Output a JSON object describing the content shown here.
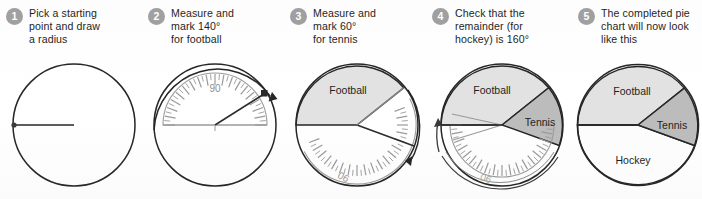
{
  "document": {
    "title": "Drawing a pie chart step by step",
    "background_color": "#ffffff"
  },
  "palette": {
    "badge_fill": "#a0a0a0",
    "badge_text": "#ffffff",
    "outline": "#262626",
    "football_fill": "#e2e2e2",
    "tennis_fill": "#bcbcbc",
    "hockey_fill": "#fcfcfc",
    "protractor_line": "#9a9a9a",
    "text": "#1f1f1f"
  },
  "steps": [
    {
      "number": "1",
      "text": "Pick a starting\npoint and draw\na radius",
      "figure": "circle-with-radius",
      "labels": []
    },
    {
      "number": "2",
      "text": "Measure and\nmark 140°\nfor football",
      "figure": "protractor-top-measure-140",
      "labels": [
        {
          "name": "protractor-90-label",
          "text": "90"
        }
      ]
    },
    {
      "number": "3",
      "text": "Measure and\nmark 60°\nfor tennis",
      "figure": "football-sector-protractor-measure-60",
      "labels": [
        {
          "name": "sector-label-football",
          "text": "Football"
        },
        {
          "name": "protractor-90-label",
          "text": "90"
        }
      ]
    },
    {
      "number": "4",
      "text": "Check that the\nremainder (for\nhockey) is 160°",
      "figure": "football-tennis-sectors-check-160",
      "labels": [
        {
          "name": "sector-label-football",
          "text": "Football"
        },
        {
          "name": "sector-label-tennis",
          "text": "Tennis"
        },
        {
          "name": "protractor-90-label",
          "text": "90"
        }
      ]
    },
    {
      "number": "5",
      "text": "The completed pie\nchart will now look\nlike this",
      "figure": "completed-pie-chart",
      "labels": [
        {
          "name": "sector-label-football",
          "text": "Football"
        },
        {
          "name": "sector-label-tennis",
          "text": "Tennis"
        },
        {
          "name": "sector-label-hockey",
          "text": "Hockey"
        }
      ]
    }
  ],
  "chart_data": {
    "type": "pie",
    "title": "The completed pie chart will now look like this",
    "categories": [
      "Football",
      "Tennis",
      "Hockey"
    ],
    "values": [
      140,
      60,
      160
    ],
    "unit": "degrees",
    "total": 360,
    "colors": [
      "#e2e2e2",
      "#bcbcbc",
      "#fcfcfc"
    ],
    "start_angle_deg": 180,
    "direction": "clockwise",
    "legend": "none",
    "grid": false,
    "annotations": [
      "Measure and mark 140° for football",
      "Measure and mark 60° for tennis",
      "Check that the remainder (for hockey) is 160°"
    ]
  }
}
